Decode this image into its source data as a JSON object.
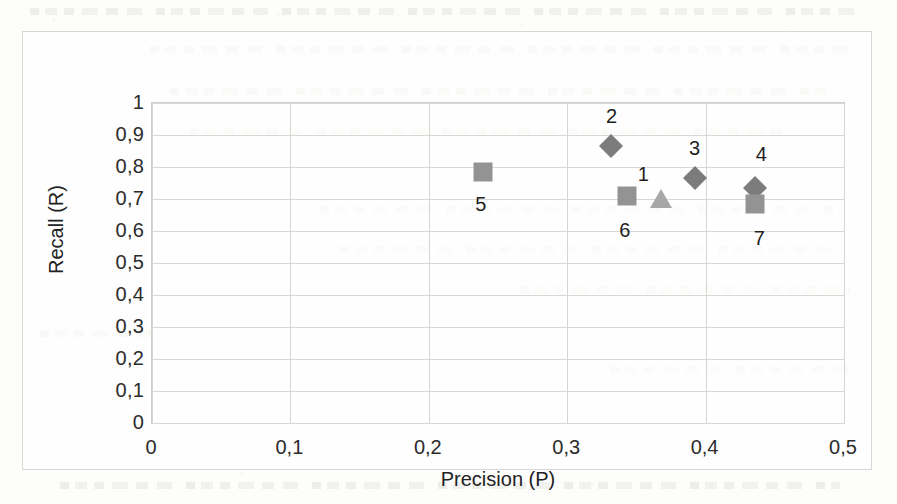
{
  "chart_data": {
    "type": "scatter",
    "title": "",
    "xlabel": "Precision (P)",
    "ylabel": "Recall (R)",
    "xlim": [
      0,
      0.5
    ],
    "ylim": [
      0,
      1
    ],
    "grid": true,
    "legend": "none",
    "x_ticks": [
      "0",
      "0,1",
      "0,2",
      "0,3",
      "0,4",
      "0,5"
    ],
    "x_tick_values": [
      0,
      0.1,
      0.2,
      0.3,
      0.4,
      0.5
    ],
    "y_ticks": [
      "0",
      "0,1",
      "0,2",
      "0,3",
      "0,4",
      "0,5",
      "0,6",
      "0,7",
      "0,8",
      "0,9",
      "1"
    ],
    "y_tick_values": [
      0,
      0.1,
      0.2,
      0.3,
      0.4,
      0.5,
      0.6,
      0.7,
      0.8,
      0.9,
      1
    ],
    "points": [
      {
        "label": "1",
        "marker": "triangle",
        "color": "#a7a7a7",
        "x": 0.368,
        "y": 0.697,
        "label_dx": -18,
        "label_dy": -26
      },
      {
        "label": "2",
        "marker": "diamond",
        "color": "#7c7c7c",
        "x": 0.332,
        "y": 0.866,
        "label_dx": 0,
        "label_dy": -30
      },
      {
        "label": "3",
        "marker": "diamond",
        "color": "#7c7c7c",
        "x": 0.392,
        "y": 0.766,
        "label_dx": 0,
        "label_dy": -30
      },
      {
        "label": "4",
        "marker": "diamond",
        "color": "#7c7c7c",
        "x": 0.436,
        "y": 0.734,
        "label_dx": 6,
        "label_dy": -34
      },
      {
        "label": "5",
        "marker": "square",
        "color": "#939393",
        "x": 0.239,
        "y": 0.783,
        "label_dx": -2,
        "label_dy": 32
      },
      {
        "label": "6",
        "marker": "square",
        "color": "#939393",
        "x": 0.343,
        "y": 0.71,
        "label_dx": -2,
        "label_dy": 34
      },
      {
        "label": "7",
        "marker": "square",
        "color": "#939393",
        "x": 0.436,
        "y": 0.685,
        "label_dx": 4,
        "label_dy": 34
      }
    ]
  }
}
